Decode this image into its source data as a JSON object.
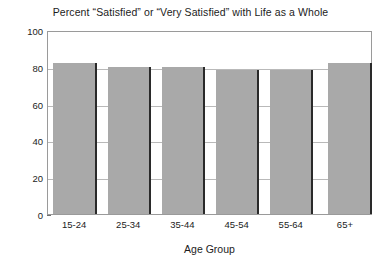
{
  "chart_data": {
    "type": "bar",
    "title": "Percent “Satisfied” or “Very Satisfied” with Life as a Whole",
    "xlabel": "Age Group",
    "ylabel": "",
    "categories": [
      "15-24",
      "25-34",
      "35-44",
      "45-54",
      "55-64",
      "65+"
    ],
    "values": [
      82,
      80,
      80,
      78,
      78,
      82
    ],
    "ylim": [
      0,
      100
    ],
    "yticks": [
      0,
      20,
      40,
      60,
      80,
      100
    ],
    "ytick_labels": [
      "0",
      "20",
      "40",
      "60",
      "80",
      "100"
    ],
    "grid": true,
    "legend": false,
    "bar_color": "#a9a9a9",
    "bar_edge_color": "#2a2a2a",
    "frame_color": "#9a9a9a",
    "gridline_color": "#b9b9b9",
    "background_color": "#ffffff",
    "text_color": "#1c1c1c"
  }
}
